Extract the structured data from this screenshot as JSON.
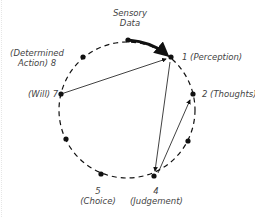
{
  "diagram": {
    "input_label_line1": "Sensory",
    "input_label_line2": "Data",
    "nodes": [
      {
        "id": "1",
        "label": "1 (Perception)"
      },
      {
        "id": "2",
        "label": "2 (Thoughts)"
      },
      {
        "id": "4",
        "label_line1": "4",
        "label_line2": "(Judgement)"
      },
      {
        "id": "5",
        "label_line1": "5",
        "label_line2": "(Choice)"
      },
      {
        "id": "7",
        "label": "(Will) 7"
      },
      {
        "id": "8",
        "label_line1": "(Determined",
        "label_line2": "Action) 8"
      }
    ],
    "edges": [
      {
        "from": "Sensory Data",
        "to": "1",
        "style": "bold-curved-arrow"
      },
      {
        "from": "7",
        "to": "1",
        "style": "arrow"
      },
      {
        "from": "1",
        "to": "4",
        "style": "arrow"
      },
      {
        "from": "4",
        "to": "2",
        "style": "arrow"
      }
    ],
    "colors": {
      "stroke": "#111111",
      "text": "#444444"
    }
  }
}
